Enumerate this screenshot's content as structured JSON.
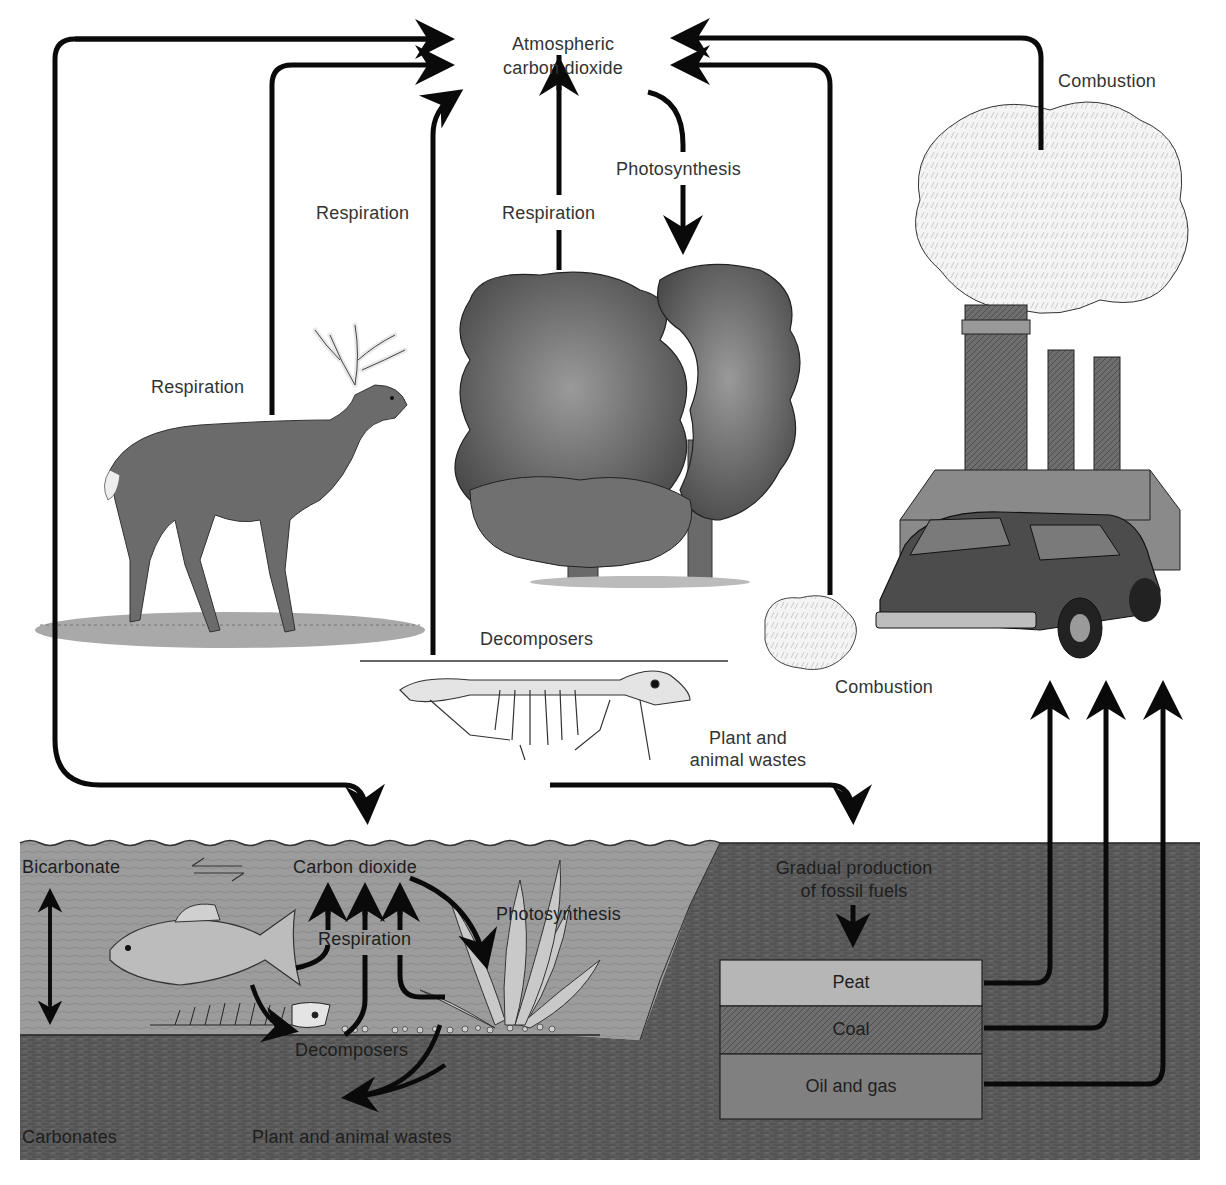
{
  "diagram": {
    "type": "carbon-cycle",
    "atmosphere": {
      "label_line1": "Atmospheric",
      "label_line2": "carbon dioxide"
    },
    "land": {
      "deer_respiration": "Respiration",
      "decomposer_respiration": "Respiration",
      "tree_respiration": "Respiration",
      "tree_photosynthesis": "Photosynthesis",
      "decomposers": "Decomposers",
      "wastes_line1": "Plant and",
      "wastes_line2": "animal wastes",
      "car_combustion": "Combustion",
      "factory_combustion": "Combustion"
    },
    "water": {
      "bicarbonate": "Bicarbonate",
      "equilibrium_symbol": "⇌",
      "carbon_dioxide": "Carbon dioxide",
      "photosynthesis": "Photosynthesis",
      "respiration": "Respiration",
      "decomposers": "Decomposers",
      "carbonates": "Carbonates",
      "wastes": "Plant and animal wastes"
    },
    "fossil": {
      "production_line1": "Gradual production",
      "production_line2": "of fossil fuels",
      "layers": [
        {
          "label": "Peat",
          "color": "#b4b4b4"
        },
        {
          "label": "Coal",
          "color": "#5e5e5e"
        },
        {
          "label": "Oil and gas",
          "color": "#7e7e7e"
        }
      ]
    },
    "colors": {
      "arrow": "#0a0a0a",
      "water": "#9a9a9a",
      "soil": "#5a5a5a",
      "background": "#ffffff"
    },
    "illustrations": [
      "deer",
      "trees",
      "animal-skeleton",
      "factory-smokestacks",
      "smoke-cloud",
      "station-wagon-car",
      "exhaust-cloud",
      "fish",
      "fish-skeleton",
      "aquatic-plant"
    ]
  }
}
